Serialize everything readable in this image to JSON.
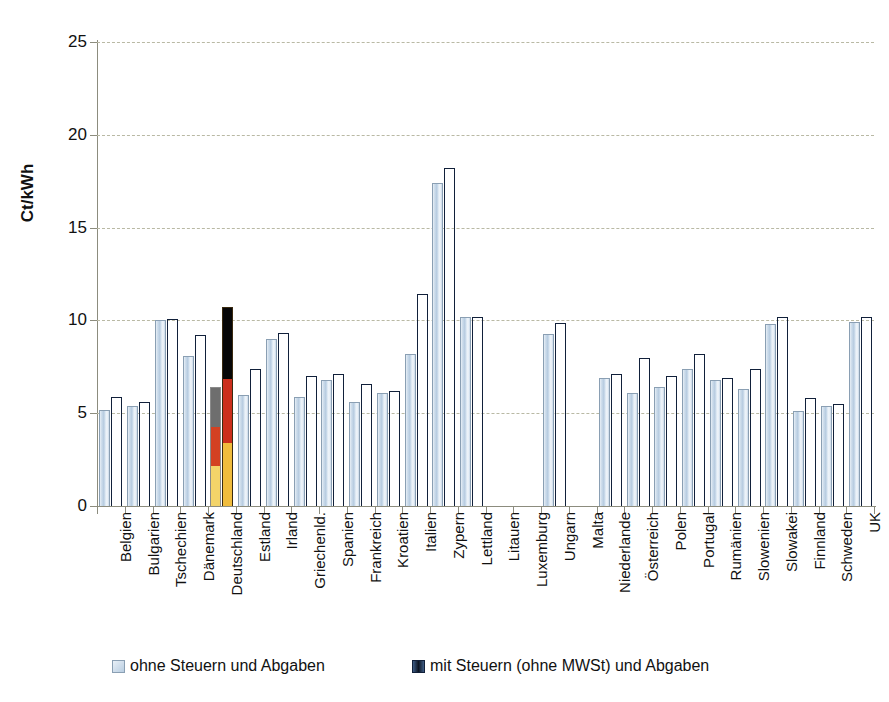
{
  "chart_data": {
    "type": "bar",
    "title": "",
    "subtitle": "",
    "xlabel": "",
    "ylabel": "Ct/kWh",
    "ylim": [
      0,
      25
    ],
    "yticks": [
      0,
      5,
      10,
      15,
      20,
      25
    ],
    "ytick_labels": [
      "0",
      "5",
      "10",
      "15",
      "20",
      "25"
    ],
    "grid": true,
    "grid_style": "dashed-horizontal",
    "legend_position": "bottom",
    "categories": [
      "Belgien",
      "Bulgarien",
      "Tschechien",
      "Dänemark",
      "Deutschland",
      "Estland",
      "Irland",
      "Griechenld.",
      "Spanien",
      "Frankreich",
      "Kroatien",
      "Italien",
      "Zypern",
      "Lettland",
      "Litauen",
      "Luxemburg",
      "Ungarn",
      "Malta",
      "Niederlande",
      "Österreich",
      "Polen",
      "Portugal",
      "Rumänien",
      "Slowenien",
      "Slowakei",
      "Finnland",
      "Schweden",
      "UK"
    ],
    "series": [
      {
        "name": "ohne Steuern und Abgaben",
        "color": "#c3d6e8",
        "values": [
          5.2,
          5.4,
          10.0,
          8.1,
          6.4,
          6.0,
          9.0,
          5.9,
          6.8,
          5.6,
          6.1,
          8.2,
          17.4,
          10.2,
          null,
          null,
          9.25,
          null,
          6.9,
          6.1,
          6.4,
          7.4,
          6.8,
          6.3,
          9.8,
          5.1,
          5.4,
          9.9
        ]
      },
      {
        "name": "mit Steuern (ohne MWSt) und Abgaben",
        "color": "#12243f",
        "values": [
          5.9,
          5.6,
          10.1,
          9.2,
          10.7,
          7.4,
          9.3,
          7.0,
          7.1,
          6.6,
          6.2,
          11.4,
          18.2,
          10.2,
          null,
          null,
          9.85,
          null,
          7.1,
          8.0,
          7.0,
          8.2,
          6.9,
          7.4,
          10.2,
          5.8,
          5.5,
          10.2
        ]
      }
    ],
    "highlight": {
      "category": "Deutschland",
      "style": "german-flag-colors",
      "colors": [
        "#000000",
        "#cc2f1c",
        "#f0bc3d"
      ]
    }
  },
  "legend": {
    "items": [
      {
        "label": "ohne Steuern und Abgaben",
        "swatch": "light"
      },
      {
        "label": "mit Steuern (ohne MWSt) und Abgaben",
        "swatch": "dark"
      }
    ]
  },
  "axes": {
    "y_title": "Ct/kWh"
  }
}
